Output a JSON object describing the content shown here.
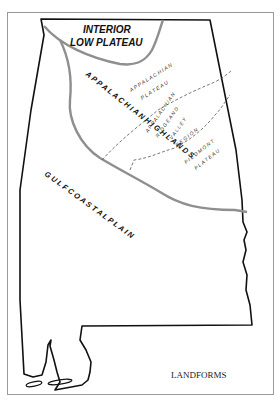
{
  "map": {
    "title": "LANDFORMS",
    "regions": [
      {
        "id": "interior-low-plateau",
        "label_line1": "INTERIOR",
        "label_line2": "LOW PLATEAU"
      },
      {
        "id": "appalachian-highlands",
        "label": "A P P A L A C H I A N   H I G H L A N D S"
      },
      {
        "id": "appalachian-plateau",
        "label_line1": "A P P A L A C H I A N",
        "label_line2": "P L A T E A U"
      },
      {
        "id": "ridge-and-valley",
        "label_line1": "A P P A L A C H I A N",
        "label_line2": "R I D G E   A N D",
        "label_line3": "V A L L E Y",
        "label_line4": "R E G I O N"
      },
      {
        "id": "piedmont-plateau",
        "label_line1": "P I E D M O N T",
        "label_line2": "P L A T E A U"
      },
      {
        "id": "gulf-coastal-plain",
        "label": "G U L F     C O A S T A L     P L A I N"
      }
    ],
    "colors": {
      "state_outline": "#111111",
      "region_boundary": "#8f8f8f",
      "subregion_boundary": "#555555",
      "frame": "#9a9a9a"
    }
  }
}
